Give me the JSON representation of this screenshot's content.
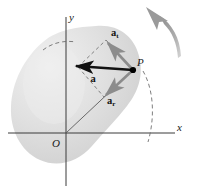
{
  "figure": {
    "name": "acceleration-components-diagram"
  },
  "axes": {
    "x_label": "x",
    "y_label": "y",
    "origin_label": "O",
    "axis_color": "#3a3a3a"
  },
  "points": {
    "p_label": "P",
    "p_marker_color": "#000000"
  },
  "vectors": [
    {
      "id": "resultant",
      "base": "a",
      "subscript": "",
      "label": "a",
      "color": "#111111",
      "role": "resultant-acceleration"
    },
    {
      "id": "tangential",
      "base": "a",
      "subscript": "t",
      "label": "at",
      "color": "#8c8c8c",
      "role": "tangential-component"
    },
    {
      "id": "radial",
      "base": "a",
      "subscript": "r",
      "label": "ar",
      "color": "#8c8c8c",
      "role": "radial-component"
    }
  ],
  "body": {
    "fill_light": "#ededed",
    "fill_mid": "#d9d9d9",
    "fill_dark": "#c7c7c7",
    "shape": "bean-blob"
  },
  "rotation_arrow": {
    "name": "rotation-direction-arrow",
    "color": "#9a9a9a",
    "direction": "counterclockwise"
  },
  "construction": {
    "dashed_color": "#6f6f6f",
    "radius_line_color": "#5a5a5a"
  }
}
